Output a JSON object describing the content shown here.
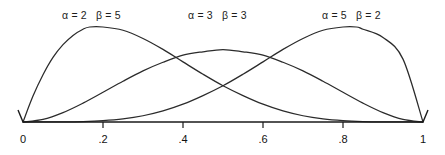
{
  "figure": {
    "title": "",
    "background_color": "#ffffff",
    "line_color": "#2b2b2b",
    "axis_color": "#1a1a1a"
  },
  "axis": {
    "tick_labels": [
      "0",
      ".2",
      ".4",
      ".6",
      ".8",
      "1"
    ],
    "tick_values": [
      0,
      0.2,
      0.4,
      0.6,
      0.8,
      1
    ]
  },
  "labels": [
    {
      "alpha_text": "α = 2",
      "beta_text": "β = 5",
      "left_px": 62,
      "top_px": 9
    },
    {
      "alpha_text": "α = 3",
      "beta_text": "β = 3",
      "left_px": 188,
      "top_px": 9
    },
    {
      "alpha_text": "α = 5",
      "beta_text": "β = 2",
      "left_px": 322,
      "top_px": 9
    }
  ],
  "chart_data": {
    "type": "line",
    "title": "",
    "xlabel": "",
    "ylabel": "",
    "xlim": [
      0,
      1
    ],
    "ylim": [
      0,
      2.6
    ],
    "grid": false,
    "legend_position": "inline-above-curves",
    "xticks": [
      0,
      0.2,
      0.4,
      0.6,
      0.8,
      1
    ],
    "xticklabels": [
      "0",
      ".2",
      ".4",
      ".6",
      ".8",
      "1"
    ],
    "yticks": [],
    "yticklabels": [],
    "series": [
      {
        "name": "α = 2  β = 5",
        "alpha": 2,
        "beta": 5,
        "mode_x": 0.1667,
        "peak_y": 2.4576,
        "x": [
          0.0,
          0.025,
          0.05,
          0.075,
          0.1,
          0.125,
          0.15,
          0.1667,
          0.2,
          0.25,
          0.3,
          0.35,
          0.4,
          0.45,
          0.5,
          0.55,
          0.6,
          0.65,
          0.7,
          0.75,
          0.8,
          0.85,
          0.9,
          0.95,
          1.0
        ],
        "y": [
          0.0,
          0.6697,
          1.221,
          1.6705,
          2.0,
          2.24,
          2.4,
          2.4576,
          2.4576,
          2.373,
          2.1609,
          1.8785,
          1.5552,
          1.2354,
          0.9375,
          0.6834,
          0.4608,
          0.2866,
          0.162,
          0.082,
          0.036,
          0.0127,
          0.003,
          0.0004,
          0.0
        ]
      },
      {
        "name": "α = 3  β = 3",
        "alpha": 3,
        "beta": 3,
        "mode_x": 0.5,
        "peak_y": 1.875,
        "x": [
          0.0,
          0.05,
          0.1,
          0.15,
          0.2,
          0.25,
          0.3,
          0.35,
          0.4,
          0.45,
          0.5,
          0.55,
          0.6,
          0.65,
          0.7,
          0.75,
          0.8,
          0.85,
          0.9,
          0.95,
          1.0
        ],
        "y": [
          0.0,
          0.0677,
          0.243,
          0.4879,
          0.768,
          1.0547,
          1.323,
          1.5454,
          1.728,
          1.8169,
          1.875,
          1.8169,
          1.728,
          1.5454,
          1.323,
          1.0547,
          0.768,
          0.4879,
          0.243,
          0.0677,
          0.0
        ]
      },
      {
        "name": "α = 5  β = 2",
        "alpha": 5,
        "beta": 2,
        "mode_x": 0.8333,
        "peak_y": 2.4576,
        "x": [
          0.0,
          0.05,
          0.1,
          0.15,
          0.2,
          0.25,
          0.3,
          0.35,
          0.4,
          0.45,
          0.5,
          0.55,
          0.6,
          0.65,
          0.7,
          0.75,
          0.8,
          0.8333,
          0.85,
          0.9,
          0.95,
          1.0
        ],
        "y": [
          0.0,
          0.0004,
          0.003,
          0.0127,
          0.036,
          0.082,
          0.162,
          0.2866,
          0.4608,
          0.6834,
          0.9375,
          1.2354,
          1.5552,
          1.8785,
          2.1609,
          2.373,
          2.4576,
          2.4576,
          2.4,
          2.187,
          1.6269,
          0.0
        ]
      }
    ]
  }
}
